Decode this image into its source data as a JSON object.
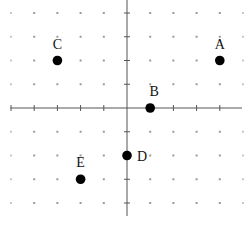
{
  "chart_data": {
    "type": "scatter",
    "title": "",
    "xlabel": "",
    "ylabel": "",
    "xlim": [
      -5,
      5
    ],
    "ylim": [
      -4,
      4
    ],
    "grid": "dot-lattice at every integer coordinate",
    "x_ticks": [
      -5,
      -4,
      -3,
      -2,
      -1,
      1,
      2,
      3,
      4
    ],
    "y_ticks": [
      -4,
      -3,
      -2,
      -1,
      1,
      2,
      3,
      4
    ],
    "points": [
      {
        "label": "A",
        "x": 4,
        "y": 2,
        "label_position": "above"
      },
      {
        "label": "B",
        "x": 1,
        "y": 0,
        "label_position": "above"
      },
      {
        "label": "C",
        "x": -3,
        "y": 2,
        "label_position": "above"
      },
      {
        "label": "D",
        "x": 0,
        "y": -2,
        "label_position": "right"
      },
      {
        "label": "E",
        "x": -2,
        "y": -3,
        "label_position": "above"
      }
    ]
  },
  "colors": {
    "point": "#000000",
    "axis": "#555555",
    "grid_dot": "#9a9a9a"
  }
}
